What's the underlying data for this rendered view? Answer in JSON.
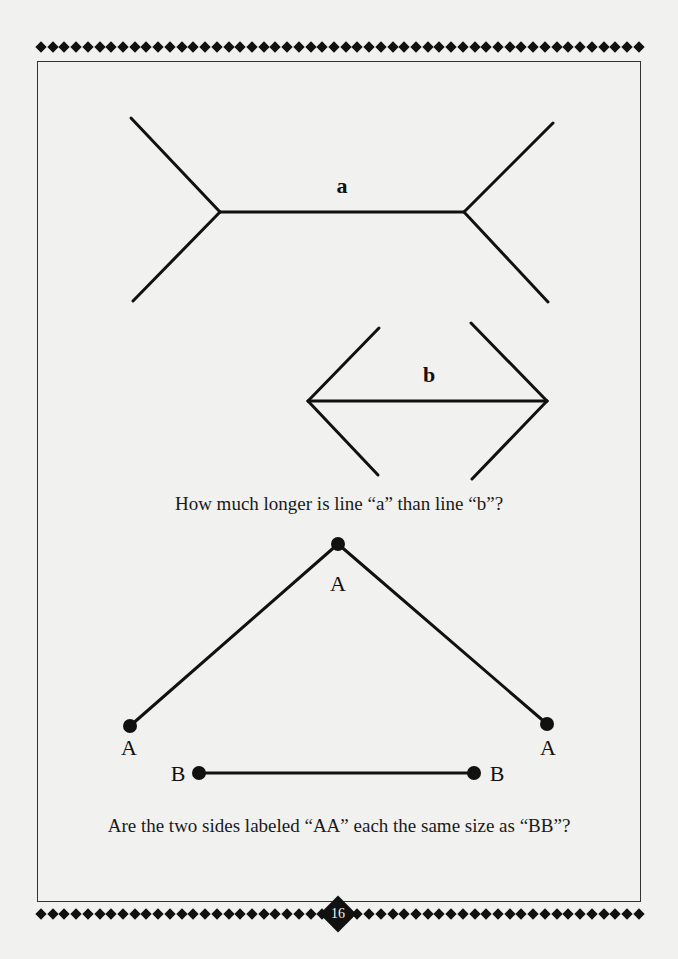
{
  "page": {
    "number": "16",
    "background": "#f1f1ef",
    "ink": "#111111"
  },
  "figure_a": {
    "label": "a",
    "shaft": {
      "x1": 220,
      "y1": 212,
      "x2": 464,
      "y2": 212
    },
    "fins": [
      {
        "x1": 220,
        "y1": 212,
        "x2": 131,
        "y2": 118
      },
      {
        "x1": 220,
        "y1": 212,
        "x2": 133,
        "y2": 301
      },
      {
        "x1": 464,
        "y1": 212,
        "x2": 553,
        "y2": 123
      },
      {
        "x1": 464,
        "y1": 212,
        "x2": 548,
        "y2": 302
      }
    ]
  },
  "figure_b": {
    "label": "b",
    "shaft": {
      "x1": 308,
      "y1": 401,
      "x2": 547,
      "y2": 401
    },
    "fins": [
      {
        "x1": 308,
        "y1": 401,
        "x2": 379,
        "y2": 328
      },
      {
        "x1": 308,
        "y1": 401,
        "x2": 378,
        "y2": 475
      },
      {
        "x1": 547,
        "y1": 401,
        "x2": 471,
        "y2": 323
      },
      {
        "x1": 547,
        "y1": 401,
        "x2": 472,
        "y2": 479
      }
    ]
  },
  "question_1": "How much longer is line “a” than line “b”?",
  "figure_aa": {
    "point_labels": [
      "A",
      "A",
      "A"
    ],
    "points": [
      {
        "x": 130,
        "y": 726
      },
      {
        "x": 338,
        "y": 544
      },
      {
        "x": 547,
        "y": 724
      }
    ]
  },
  "figure_bb": {
    "point_labels": [
      "B",
      "B"
    ],
    "points": [
      {
        "x": 199,
        "y": 773
      },
      {
        "x": 474,
        "y": 773
      }
    ]
  },
  "question_2": "Are the two sides labeled “AA” each the same size as “BB”?"
}
